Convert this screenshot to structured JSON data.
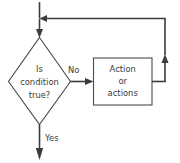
{
  "diagram": {
    "type": "flowchart",
    "colors": {
      "background": "#ffffff",
      "shape_stroke": "#4a4a4a",
      "line_stroke": "#3c3c3c",
      "text": "#3a3a3a"
    },
    "nodes": {
      "decision": {
        "shape": "diamond",
        "lines": [
          "Is",
          "condition",
          "true?"
        ]
      },
      "process": {
        "shape": "rectangle",
        "lines": [
          "Action",
          "or",
          "actions"
        ]
      }
    },
    "edge_labels": {
      "no": "No",
      "yes": "Yes"
    }
  }
}
